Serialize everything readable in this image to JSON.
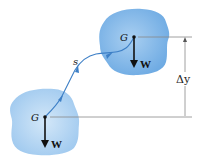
{
  "diagram": {
    "colors": {
      "body_fill": "#7fb6e8",
      "body_fill_light": "#b9d8f2",
      "path": "#3d7fc6",
      "arrow": "#111111",
      "dimension_line": "#888888"
    },
    "lower_body": {
      "center_label": "G",
      "force_label": "W"
    },
    "upper_body": {
      "center_label": "G",
      "force_label": "W"
    },
    "path_label": "s",
    "displacement_label": "Δy"
  }
}
